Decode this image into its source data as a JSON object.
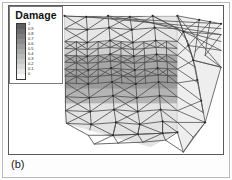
{
  "figure": {
    "panel_label": "(b)",
    "background_color": "#fdfdfd",
    "plot_border_color": "#5a5a5a",
    "outer_border_color": "#b9b9b9"
  },
  "legend": {
    "title": "Damage",
    "border_color": "#7a7a7a",
    "background_color": "#ffffff",
    "swatch_border_color": "#3a3a3a",
    "entries": [
      {
        "label": "1",
        "value": 1.0,
        "color": "#5e5e5e"
      },
      {
        "label": "0.9",
        "value": 0.9,
        "color": "#6e6e6e"
      },
      {
        "label": "0.8",
        "value": 0.8,
        "color": "#7d7d7d"
      },
      {
        "label": "0.7",
        "value": 0.7,
        "color": "#8c8c8c"
      },
      {
        "label": "0.6",
        "value": 0.6,
        "color": "#9b9b9b"
      },
      {
        "label": "0.5",
        "value": 0.5,
        "color": "#aaaaaa"
      },
      {
        "label": "0.4",
        "value": 0.4,
        "color": "#b9b9b9"
      },
      {
        "label": "0.3",
        "value": 0.3,
        "color": "#c8c8c8"
      },
      {
        "label": "0.2",
        "value": 0.2,
        "color": "#d7d7d7"
      },
      {
        "label": "0.1",
        "value": 0.1,
        "color": "#e9e9e9"
      },
      {
        "label": "0",
        "value": 0.0,
        "color": "#fbfbfb"
      }
    ]
  },
  "chart_data": {
    "type": "heatmap",
    "title": "Damage",
    "subtitle": "(b)",
    "xlabel": "",
    "ylabel": "",
    "colormap": "grayscale-inverted",
    "colorbar_range": [
      0,
      1
    ],
    "colorbar_ticks": [
      0,
      0.1,
      0.2,
      0.3,
      0.4,
      0.5,
      0.6,
      0.7,
      0.8,
      0.9,
      1
    ],
    "legend_position": "top-left",
    "grid": false,
    "axes_visible": false,
    "mesh": {
      "element_type": "triangle",
      "edge_color": "#4a4a4a",
      "node_color": "#2a2a2a",
      "visible_faces": [
        "front",
        "top",
        "right-end"
      ]
    },
    "damage_bands": [
      {
        "band": 1,
        "y_fraction_top": 0.0,
        "y_fraction_bottom": 0.24,
        "value": 0.1,
        "color": "#e6e6e6"
      },
      {
        "band": 2,
        "y_fraction_top": 0.24,
        "y_fraction_bottom": 0.33,
        "value": 0.3,
        "color": "#cfcfcf"
      },
      {
        "band": 3,
        "y_fraction_top": 0.33,
        "y_fraction_bottom": 0.45,
        "value": 0.6,
        "color": "#a6a6a6"
      },
      {
        "band": 4,
        "y_fraction_top": 0.45,
        "y_fraction_bottom": 0.56,
        "value": 0.7,
        "color": "#9a9a9a"
      },
      {
        "band": 5,
        "y_fraction_top": 0.56,
        "y_fraction_bottom": 0.66,
        "value": 0.5,
        "color": "#b4b4b4"
      },
      {
        "band": 6,
        "y_fraction_top": 0.66,
        "y_fraction_bottom": 1.0,
        "value": 0.1,
        "color": "#e3e3e3"
      }
    ]
  }
}
